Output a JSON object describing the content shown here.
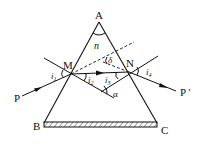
{
  "diagram": {
    "type": "prism-refraction",
    "labels": {
      "apex": "A",
      "base_left": "B",
      "base_right": "C",
      "entry_point": "M",
      "exit_point": "N",
      "incident_ray": "P",
      "emergent_ray": "P '",
      "refractive_index": "n",
      "deviation_angle": "δ",
      "normals_angle": "α",
      "angle_i1": "i",
      "angle_i1_sub": "1",
      "angle_i2": "i",
      "angle_i2_sub": "2",
      "angle_i3": "i",
      "angle_i3_sub": "3",
      "angle_i4": "i",
      "angle_i4_sub": "4"
    },
    "colors": {
      "stroke": "#111111",
      "background": "#ffffff"
    }
  }
}
